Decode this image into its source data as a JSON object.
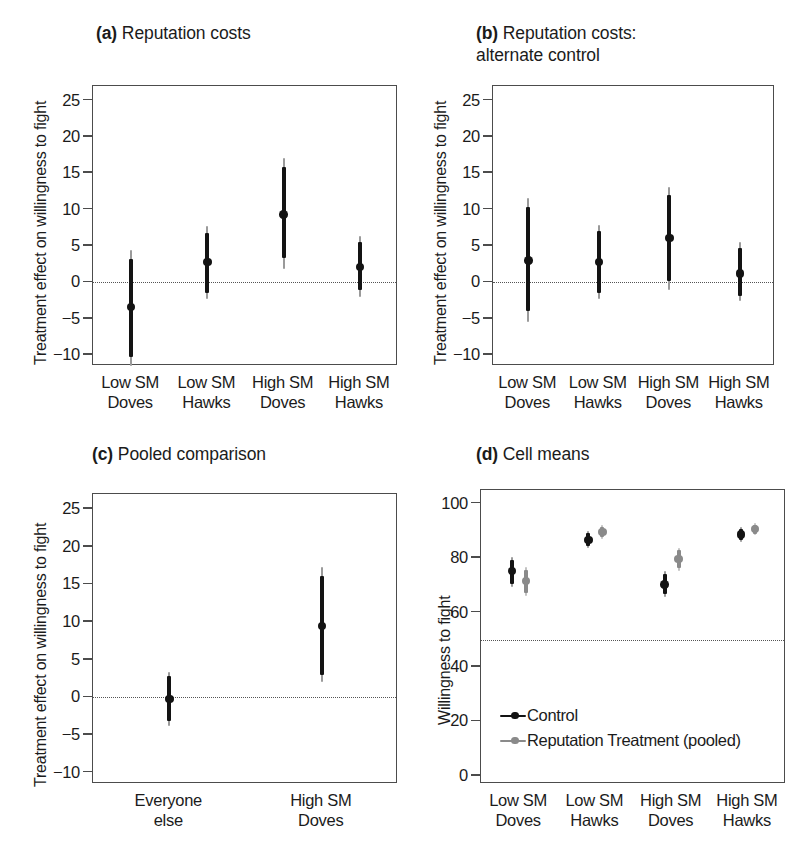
{
  "figure": {
    "background": "#ffffff",
    "series_colors": {
      "control": "#131313",
      "treatment": "#8a8a8a"
    }
  },
  "panels": {
    "a": {
      "title_marker": "(a)",
      "title": " Reputation costs",
      "ylabel": "Treatment effect on willingness to fight",
      "yticks": [
        "25",
        "20",
        "15",
        "10",
        "5",
        "0",
        "−5",
        "−10"
      ],
      "xticks": [
        "Low SM\nDoves",
        "Low SM\nHawks",
        "High SM\nDoves",
        "High SM\nHawks"
      ]
    },
    "b": {
      "title_marker": "(b)",
      "title": " Reputation costs:\nalternate control",
      "ylabel": "Treatment effect on willingness to fight",
      "yticks": [
        "25",
        "20",
        "15",
        "10",
        "5",
        "0",
        "−5",
        "−10"
      ],
      "xticks": [
        "Low SM\nDoves",
        "Low SM\nHawks",
        "High SM\nDoves",
        "High SM\nHawks"
      ]
    },
    "c": {
      "title_marker": "(c)",
      "title": " Pooled comparison",
      "ylabel": "Treatment effect on willingness to fight",
      "yticks": [
        "25",
        "20",
        "15",
        "10",
        "5",
        "0",
        "−5",
        "−10"
      ],
      "xticks": [
        "Everyone\nelse",
        "High SM\nDoves"
      ]
    },
    "d": {
      "title_marker": "(d)",
      "title": " Cell means",
      "ylabel": "Willingness to fight",
      "yticks": [
        "100",
        "80",
        "60",
        "40",
        "20",
        "0"
      ],
      "xticks": [
        "Low SM\nDoves",
        "Low SM\nHawks",
        "High SM\nDoves",
        "High SM\nHawks"
      ],
      "legend": [
        {
          "label": "Control",
          "color": "#131313"
        },
        {
          "label": "Reputation Treatment (pooled)",
          "color": "#8a8a8a"
        }
      ]
    }
  },
  "chart_data": [
    {
      "id": "a",
      "type": "scatter",
      "title": "(a) Reputation costs",
      "xlabel": "",
      "ylabel": "Treatment effect on willingness to fight",
      "ylim": [
        -11.5,
        27.0
      ],
      "yticks": [
        25,
        20,
        15,
        10,
        5,
        0,
        -5,
        -10
      ],
      "grid": false,
      "reference_line": {
        "y": 0,
        "style": "dotted"
      },
      "categories": [
        "Low SM Doves",
        "Low SM Hawks",
        "High SM Doves",
        "High SM Hawks"
      ],
      "series": [
        {
          "name": "Treatment effect",
          "color": "#131313",
          "estimates": [
            -3.4,
            2.8,
            9.3,
            2.1
          ],
          "ci_inner_low": [
            -10.2,
            -1.5,
            3.3,
            -1.1
          ],
          "ci_inner_high": [
            3.2,
            6.8,
            15.8,
            5.5
          ],
          "ci_outer_low": [
            -11.5,
            -2.3,
            1.8,
            -2.0
          ],
          "ci_outer_high": [
            4.4,
            7.8,
            17.1,
            6.4
          ]
        }
      ]
    },
    {
      "id": "b",
      "type": "scatter",
      "title": "(b) Reputation costs: alternate control",
      "xlabel": "",
      "ylabel": "Treatment effect on willingness to fight",
      "ylim": [
        -11.5,
        27.0
      ],
      "yticks": [
        25,
        20,
        15,
        10,
        5,
        0,
        -5,
        -10
      ],
      "grid": false,
      "reference_line": {
        "y": 0,
        "style": "dotted"
      },
      "categories": [
        "Low SM Doves",
        "Low SM Hawks",
        "High SM Doves",
        "High SM Hawks"
      ],
      "series": [
        {
          "name": "Treatment effect",
          "color": "#131313",
          "estimates": [
            3.0,
            2.8,
            6.1,
            1.2
          ],
          "ci_inner_low": [
            -4.0,
            -1.4,
            0.2,
            -1.9
          ],
          "ci_inner_high": [
            10.3,
            7.0,
            12.0,
            4.7
          ],
          "ci_outer_low": [
            -5.4,
            -2.3,
            -1.0,
            -2.6
          ],
          "ci_outer_high": [
            11.6,
            7.9,
            13.1,
            5.6
          ]
        }
      ]
    },
    {
      "id": "c",
      "type": "scatter",
      "title": "(c) Pooled comparison",
      "xlabel": "",
      "ylabel": "Treatment effect on willingness to fight",
      "ylim": [
        -11.5,
        27.0
      ],
      "yticks": [
        25,
        20,
        15,
        10,
        5,
        0,
        -5,
        -10
      ],
      "grid": false,
      "reference_line": {
        "y": 0,
        "style": "dotted"
      },
      "categories": [
        "Everyone else",
        "High SM Doves"
      ],
      "series": [
        {
          "name": "Treatment effect",
          "color": "#131313",
          "estimates": [
            -0.2,
            9.5
          ],
          "ci_inner_low": [
            -3.1,
            3.0
          ],
          "ci_inner_high": [
            2.8,
            16.1
          ],
          "ci_outer_low": [
            -3.8,
            2.0
          ],
          "ci_outer_high": [
            3.4,
            17.3
          ]
        }
      ]
    },
    {
      "id": "d",
      "type": "scatter",
      "title": "(d) Cell means",
      "xlabel": "",
      "ylabel": "Willingness to fight",
      "ylim": [
        -3.0,
        105.0
      ],
      "yticks": [
        100,
        80,
        60,
        40,
        20,
        0
      ],
      "grid": false,
      "reference_line": {
        "y": 50,
        "style": "dotted"
      },
      "categories": [
        "Low SM Doves",
        "Low SM Hawks",
        "High SM Doves",
        "High SM Hawks"
      ],
      "series": [
        {
          "name": "Control",
          "color": "#131313",
          "estimates": [
            75.2,
            86.6,
            70.3,
            88.6
          ],
          "ci_inner_low": [
            70.6,
            84.3,
            66.9,
            86.6
          ],
          "ci_inner_high": [
            79.4,
            89.2,
            74.0,
            90.8
          ],
          "ci_outer_low": [
            69.3,
            83.6,
            65.8,
            86.0
          ],
          "ci_outer_high": [
            80.4,
            89.9,
            75.1,
            91.4
          ]
        },
        {
          "name": "Reputation Treatment (pooled)",
          "color": "#8a8a8a",
          "estimates": [
            71.5,
            89.5,
            79.7,
            90.6
          ],
          "ci_inner_low": [
            67.1,
            87.6,
            76.2,
            88.9
          ],
          "ci_inner_high": [
            75.6,
            91.4,
            82.8,
            92.3
          ],
          "ci_outer_low": [
            65.9,
            87.0,
            75.3,
            88.4
          ],
          "ci_outer_high": [
            76.7,
            92.0,
            83.6,
            92.8
          ]
        }
      ]
    }
  ]
}
